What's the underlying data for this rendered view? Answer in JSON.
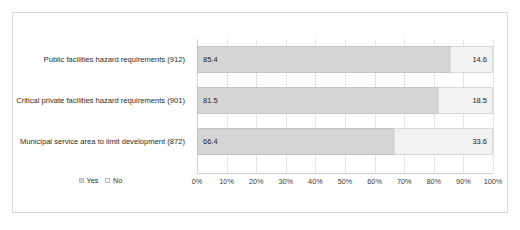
{
  "chart_data": {
    "type": "bar",
    "subtype": "stacked-horizontal-100pct",
    "title": "",
    "subtitle": "",
    "xlabel": "",
    "ylabel": "",
    "xlim": [
      0,
      100
    ],
    "grid": true,
    "legend_position": "bottom-left",
    "categories": [
      "Public facilities hazard requirements (912)",
      "Critical private facilities hazard requirements (901)",
      "Municipal service area to limit development (872)"
    ],
    "series": [
      {
        "name": "Yes",
        "color": "#d5d5d5",
        "values": [
          85.4,
          81.5,
          66.4
        ]
      },
      {
        "name": "No",
        "color": "#f2f2f2",
        "values": [
          14.6,
          18.5,
          33.6
        ]
      }
    ],
    "data_labels": [
      {
        "yes": "85.4",
        "no": "14.6"
      },
      {
        "yes": "81.5",
        "no": "18.5"
      },
      {
        "yes": "66.4",
        "no": "33.6"
      }
    ],
    "xticks": [
      0,
      10,
      20,
      30,
      40,
      50,
      60,
      70,
      80,
      90,
      100
    ],
    "xticklabels": [
      "0%",
      "10%",
      "20%",
      "30%",
      "40%",
      "50%",
      "60%",
      "70%",
      "80%",
      "90%",
      "100%"
    ]
  },
  "legend": {
    "items": [
      {
        "label": "Yes",
        "swatch": "yes"
      },
      {
        "label": "No",
        "swatch": "no"
      }
    ]
  },
  "colors": {
    "series_yes": "#d5d5d5",
    "series_no": "#f2f2f2",
    "frame_border": "#d9d9d9",
    "gridline": "#e4e4e4",
    "text": "#2b2b2b"
  }
}
